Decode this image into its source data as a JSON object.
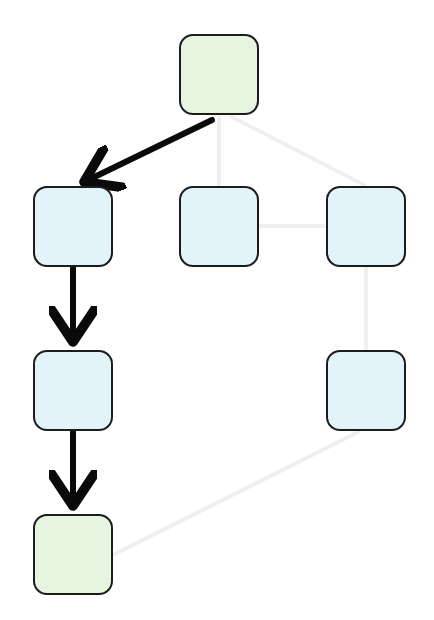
{
  "diagram": {
    "type": "tree-search-path",
    "colors": {
      "background": "#ffffff",
      "node_blue": "#e3f3fa",
      "node_green": "#e6f5df",
      "node_border": "#1c1c1c",
      "path_edge": "#0a0a0a",
      "faint_edge": "#eeeeee"
    },
    "nodes": [
      {
        "id": "n0",
        "color": "green",
        "x": 179,
        "y": 34
      },
      {
        "id": "n1",
        "color": "blue",
        "x": 33,
        "y": 186
      },
      {
        "id": "n2",
        "color": "blue",
        "x": 179,
        "y": 186
      },
      {
        "id": "n3",
        "color": "blue",
        "x": 326,
        "y": 186
      },
      {
        "id": "n4",
        "color": "blue",
        "x": 33,
        "y": 350
      },
      {
        "id": "n5",
        "color": "blue",
        "x": 326,
        "y": 350
      },
      {
        "id": "n6",
        "color": "green",
        "x": 33,
        "y": 514
      }
    ],
    "highlighted_edges": [
      {
        "from": "n0",
        "to": "n1"
      },
      {
        "from": "n1",
        "to": "n4"
      },
      {
        "from": "n4",
        "to": "n6"
      }
    ],
    "faint_edges": [
      {
        "from": "n0",
        "to": "n2"
      },
      {
        "from": "n0",
        "to": "n3"
      },
      {
        "from": "n2",
        "to": "n3"
      },
      {
        "from": "n3",
        "to": "n5"
      },
      {
        "from": "n5",
        "to": "n6"
      }
    ]
  }
}
